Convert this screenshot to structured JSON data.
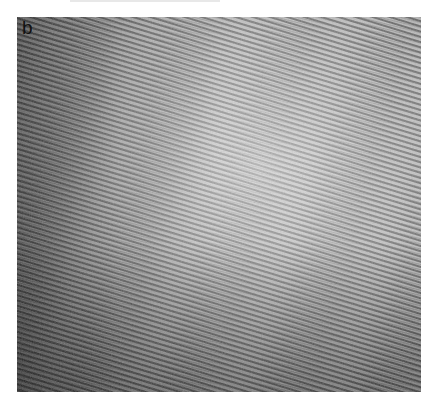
{
  "figure": {
    "panel_label": "b",
    "colors": {
      "background": "#ffffff",
      "fringe_dark": "#3a3a3a",
      "fringe_light": "#c8c8c8",
      "mid_gray": "#9a9a9a"
    }
  }
}
